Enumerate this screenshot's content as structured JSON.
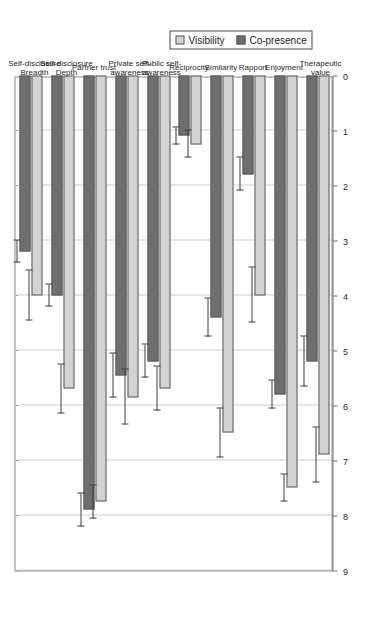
{
  "chart_data": {
    "type": "bar",
    "orientation": "horizontal",
    "rotated_view": "90deg-counter-clockwise",
    "title": "",
    "subtitle": "",
    "xlabel": "",
    "ylabel": "",
    "grid": true,
    "axis_range": [
      0,
      9
    ],
    "axis_ticks": [
      "0",
      "1",
      "2",
      "3",
      "4",
      "5",
      "6",
      "7",
      "8",
      "9"
    ],
    "axis_reversed": true,
    "legend_position": "right",
    "categories": [
      "Self-disclosure Breadth",
      "Self-disclosure Depth",
      "Partner trust",
      "Private self-awareness",
      "Public self-awareness",
      "Reciprocity",
      "Similarity",
      "Rapport",
      "Enjoyment",
      "Therapeutic value"
    ],
    "category_lines": [
      [
        "Self-disclosure",
        "Breadth"
      ],
      [
        "Self-disclosure",
        "Depth"
      ],
      [
        "Partner trust"
      ],
      [
        "Private self-",
        "awareness"
      ],
      [
        "Public self-",
        "awareness"
      ],
      [
        "Reciprocity"
      ],
      [
        "Similarity"
      ],
      [
        "Rapport"
      ],
      [
        "Enjoyment"
      ],
      [
        "Therapeutic",
        "value"
      ]
    ],
    "series": [
      {
        "name": "Visibility",
        "color": "#d2d2d2",
        "values": [
          4.0,
          5.7,
          7.75,
          5.85,
          5.7,
          1.25,
          6.5,
          4.0,
          7.5,
          6.9
        ],
        "errors": [
          0.45,
          0.45,
          0.3,
          0.5,
          0.4,
          0.25,
          0.45,
          0.5,
          0.25,
          0.5
        ]
      },
      {
        "name": "Co-presence",
        "color": "#6e6e6e",
        "values": [
          3.2,
          4.0,
          7.9,
          5.45,
          5.2,
          1.1,
          4.4,
          1.8,
          5.8,
          5.2
        ],
        "errors": [
          0.2,
          0.2,
          0.3,
          0.4,
          0.3,
          0.15,
          0.35,
          0.3,
          0.25,
          0.45
        ]
      }
    ]
  },
  "legend": {
    "items": [
      {
        "label": "Visibility",
        "color": "#d2d2d2"
      },
      {
        "label": "Co-presence",
        "color": "#6e6e6e"
      }
    ]
  },
  "colors": {
    "visibility": "#d2d2d2",
    "copresence": "#6e6e6e",
    "axis": "#6f6f6f",
    "grid": "#9a9a9a",
    "frame": "#8c8c8c",
    "error": "#3c3c3c",
    "background": "#ffffff"
  }
}
